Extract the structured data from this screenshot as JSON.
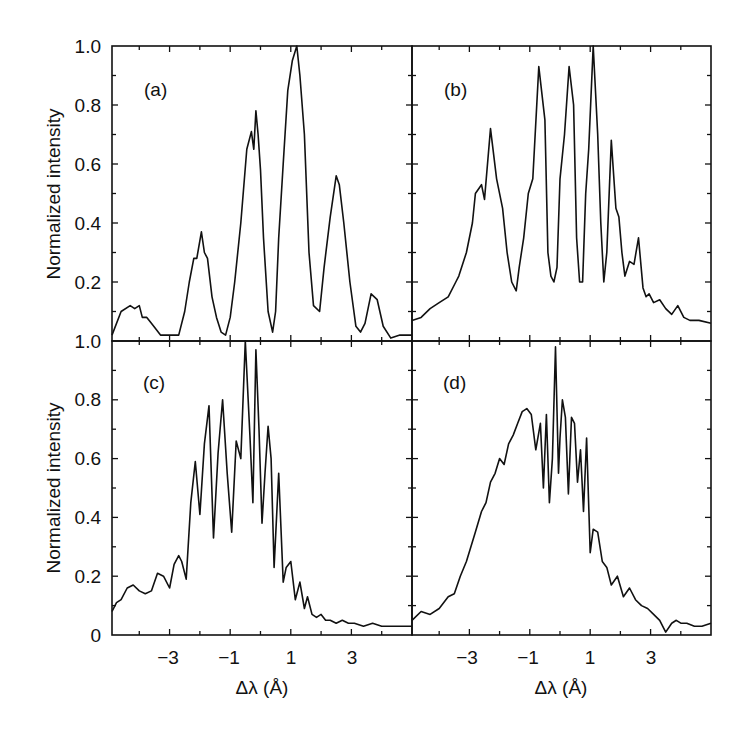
{
  "chart_data": [
    {
      "type": "line",
      "panel": "(a)",
      "xlabel": "Δλ (Å)",
      "ylabel": "Normalized intensity",
      "xlim": [
        -4.9,
        5.0
      ],
      "ylim": [
        0,
        1.0
      ],
      "x": [
        -4.9,
        -4.6,
        -4.3,
        -4.15,
        -4.0,
        -3.9,
        -3.75,
        -3.6,
        -3.3,
        -3.0,
        -2.7,
        -2.5,
        -2.35,
        -2.2,
        -2.1,
        -1.95,
        -1.85,
        -1.75,
        -1.6,
        -1.45,
        -1.3,
        -1.15,
        -1.0,
        -0.85,
        -0.65,
        -0.45,
        -0.3,
        -0.22,
        -0.15,
        -0.08,
        0.0,
        0.1,
        0.25,
        0.4,
        0.5,
        0.6,
        0.75,
        0.9,
        1.05,
        1.2,
        1.3,
        1.45,
        1.6,
        1.75,
        1.95,
        2.1,
        2.3,
        2.5,
        2.6,
        2.75,
        2.95,
        3.15,
        3.3,
        3.45,
        3.65,
        3.85,
        4.05,
        4.3,
        4.6,
        5.0
      ],
      "values": [
        0.02,
        0.1,
        0.12,
        0.11,
        0.12,
        0.08,
        0.08,
        0.06,
        0.02,
        0.02,
        0.02,
        0.1,
        0.2,
        0.28,
        0.28,
        0.37,
        0.3,
        0.28,
        0.15,
        0.08,
        0.03,
        0.02,
        0.08,
        0.2,
        0.4,
        0.65,
        0.71,
        0.65,
        0.78,
        0.7,
        0.58,
        0.35,
        0.1,
        0.03,
        0.1,
        0.35,
        0.6,
        0.85,
        0.95,
        1.0,
        0.9,
        0.7,
        0.3,
        0.12,
        0.1,
        0.25,
        0.42,
        0.56,
        0.53,
        0.4,
        0.2,
        0.05,
        0.03,
        0.06,
        0.16,
        0.14,
        0.05,
        0.01,
        0.02,
        0.02
      ],
      "y_tick_labels": [
        "1.0",
        "0.8",
        "0.6",
        "0.4",
        "0.2"
      ],
      "x_tick_labels": []
    },
    {
      "type": "line",
      "panel": "(b)",
      "xlabel": "Δλ (Å)",
      "ylabel": "",
      "xlim": [
        -4.9,
        5.0
      ],
      "ylim": [
        0,
        1.0
      ],
      "x": [
        -4.9,
        -4.6,
        -4.3,
        -4.0,
        -3.7,
        -3.45,
        -3.35,
        -3.1,
        -2.9,
        -2.8,
        -2.6,
        -2.5,
        -2.4,
        -2.3,
        -2.1,
        -1.9,
        -1.75,
        -1.6,
        -1.45,
        -1.35,
        -1.2,
        -1.05,
        -0.9,
        -0.7,
        -0.5,
        -0.4,
        -0.3,
        -0.2,
        -0.1,
        0.0,
        0.15,
        0.3,
        0.45,
        0.55,
        0.65,
        0.75,
        0.85,
        0.95,
        1.1,
        1.25,
        1.35,
        1.45,
        1.55,
        1.7,
        1.85,
        1.95,
        2.05,
        2.15,
        2.3,
        2.45,
        2.6,
        2.75,
        2.85,
        2.95,
        3.1,
        3.3,
        3.5,
        3.7,
        3.9,
        4.1,
        4.3,
        4.6,
        5.0
      ],
      "values": [
        0.07,
        0.08,
        0.11,
        0.13,
        0.15,
        0.2,
        0.22,
        0.3,
        0.4,
        0.5,
        0.53,
        0.48,
        0.6,
        0.72,
        0.55,
        0.45,
        0.3,
        0.2,
        0.17,
        0.25,
        0.35,
        0.5,
        0.55,
        0.93,
        0.75,
        0.3,
        0.22,
        0.2,
        0.25,
        0.55,
        0.7,
        0.93,
        0.8,
        0.35,
        0.2,
        0.2,
        0.5,
        0.65,
        1.0,
        0.7,
        0.4,
        0.2,
        0.3,
        0.68,
        0.45,
        0.42,
        0.3,
        0.22,
        0.27,
        0.26,
        0.35,
        0.18,
        0.15,
        0.16,
        0.13,
        0.14,
        0.11,
        0.09,
        0.12,
        0.08,
        0.07,
        0.07,
        0.06
      ],
      "y_tick_labels": [],
      "x_tick_labels": []
    },
    {
      "type": "line",
      "panel": "(c)",
      "xlabel": "Δλ (Å)",
      "ylabel": "Normalized intensity",
      "xlim": [
        -4.9,
        5.0
      ],
      "ylim": [
        0,
        1.0
      ],
      "x": [
        -4.9,
        -4.75,
        -4.6,
        -4.4,
        -4.2,
        -4.0,
        -3.8,
        -3.6,
        -3.4,
        -3.2,
        -3.0,
        -2.85,
        -2.7,
        -2.6,
        -2.45,
        -2.3,
        -2.15,
        -2.0,
        -1.85,
        -1.7,
        -1.55,
        -1.4,
        -1.25,
        -1.1,
        -0.95,
        -0.8,
        -0.65,
        -0.5,
        -0.35,
        -0.25,
        -0.15,
        -0.05,
        0.05,
        0.15,
        0.25,
        0.35,
        0.45,
        0.6,
        0.75,
        0.85,
        1.0,
        1.15,
        1.3,
        1.45,
        1.55,
        1.7,
        1.85,
        2.0,
        2.15,
        2.3,
        2.5,
        2.7,
        2.9,
        3.1,
        3.4,
        3.7,
        4.0,
        4.3,
        4.6,
        5.0
      ],
      "values": [
        0.08,
        0.11,
        0.12,
        0.16,
        0.17,
        0.15,
        0.14,
        0.15,
        0.21,
        0.2,
        0.16,
        0.24,
        0.27,
        0.25,
        0.19,
        0.45,
        0.59,
        0.41,
        0.65,
        0.78,
        0.33,
        0.62,
        0.8,
        0.55,
        0.35,
        0.66,
        0.6,
        1.0,
        0.68,
        0.45,
        0.97,
        0.7,
        0.38,
        0.55,
        0.71,
        0.6,
        0.23,
        0.55,
        0.18,
        0.23,
        0.25,
        0.12,
        0.18,
        0.09,
        0.13,
        0.07,
        0.06,
        0.07,
        0.05,
        0.05,
        0.04,
        0.05,
        0.04,
        0.04,
        0.03,
        0.04,
        0.03,
        0.03,
        0.03,
        0.03
      ],
      "y_tick_labels": [
        "1.0",
        "0.8",
        "0.6",
        "0.4",
        "0.2",
        "0"
      ],
      "x_tick_labels": [
        "−3",
        "−1",
        "1",
        "3"
      ]
    },
    {
      "type": "line",
      "panel": "(d)",
      "xlabel": "Δλ (Å)",
      "ylabel": "",
      "xlim": [
        -4.9,
        5.0
      ],
      "ylim": [
        0,
        1.0
      ],
      "x": [
        -4.9,
        -4.6,
        -4.3,
        -4.0,
        -3.7,
        -3.5,
        -3.3,
        -3.1,
        -2.95,
        -2.8,
        -2.6,
        -2.45,
        -2.3,
        -2.15,
        -2.0,
        -1.85,
        -1.7,
        -1.55,
        -1.4,
        -1.25,
        -1.1,
        -0.95,
        -0.8,
        -0.65,
        -0.55,
        -0.45,
        -0.35,
        -0.25,
        -0.15,
        -0.05,
        0.0,
        0.08,
        0.18,
        0.28,
        0.38,
        0.48,
        0.58,
        0.68,
        0.78,
        0.88,
        1.0,
        1.1,
        1.25,
        1.4,
        1.55,
        1.7,
        1.9,
        2.1,
        2.3,
        2.5,
        2.7,
        2.9,
        3.1,
        3.3,
        3.5,
        3.7,
        3.85,
        4.0,
        4.2,
        4.45,
        4.7,
        5.0
      ],
      "values": [
        0.05,
        0.08,
        0.07,
        0.09,
        0.13,
        0.14,
        0.2,
        0.25,
        0.3,
        0.35,
        0.42,
        0.45,
        0.52,
        0.55,
        0.6,
        0.58,
        0.65,
        0.68,
        0.72,
        0.76,
        0.77,
        0.75,
        0.63,
        0.72,
        0.5,
        0.75,
        0.45,
        0.6,
        0.98,
        0.55,
        0.67,
        0.8,
        0.74,
        0.48,
        0.74,
        0.72,
        0.52,
        0.63,
        0.42,
        0.67,
        0.28,
        0.36,
        0.35,
        0.25,
        0.23,
        0.17,
        0.2,
        0.13,
        0.16,
        0.12,
        0.1,
        0.09,
        0.07,
        0.05,
        0.01,
        0.04,
        0.05,
        0.04,
        0.04,
        0.03,
        0.03,
        0.04
      ],
      "y_tick_labels": [],
      "x_tick_labels": [
        "−3",
        "−1",
        "1",
        "3"
      ]
    }
  ],
  "panels": {
    "a": {
      "label": "(a)"
    },
    "b": {
      "label": "(b)"
    },
    "c": {
      "label": "(c)"
    },
    "d": {
      "label": "(d)"
    }
  },
  "axes": {
    "ylabel": "Normalized intensity",
    "xlabel": "Δλ (Å)",
    "top_y_ticks": [
      "1.0",
      "0.8",
      "0.6",
      "0.4",
      "0.2"
    ],
    "bottom_y_ticks": [
      "1.0",
      "0.8",
      "0.6",
      "0.4",
      "0.2",
      "0"
    ],
    "x_ticks": [
      "−3",
      "−1",
      "1",
      "3"
    ]
  }
}
